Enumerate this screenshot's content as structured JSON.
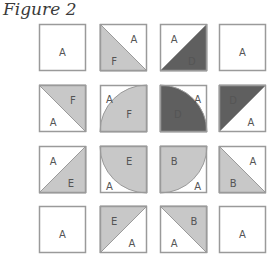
{
  "figure": {
    "title": "Figure 2",
    "colors": {
      "light": "#c8c8c8",
      "dark": "#5f5f5f",
      "white": "#ffffff",
      "border": "#9a9a9a"
    },
    "grid": [
      [
        {
          "type": "plain",
          "labels": [
            "A"
          ]
        },
        {
          "type": "hst-bl",
          "labels": [
            "A",
            "F"
          ],
          "fill": "light"
        },
        {
          "type": "hst-br",
          "labels": [
            "A",
            "D"
          ],
          "fill": "dark"
        },
        {
          "type": "plain",
          "labels": [
            "A"
          ]
        }
      ],
      [
        {
          "type": "hst-tr",
          "labels": [
            "F",
            "A"
          ],
          "fill": "light"
        },
        {
          "type": "quarter-br",
          "labels": [
            "A",
            "F"
          ],
          "fill": "light"
        },
        {
          "type": "quarter-bl",
          "labels": [
            "D",
            "A"
          ],
          "fill": "dark"
        },
        {
          "type": "hst-tl",
          "labels": [
            "D",
            "A"
          ],
          "fill": "dark"
        }
      ],
      [
        {
          "type": "hst-br",
          "labels": [
            "A",
            "E"
          ],
          "fill": "light"
        },
        {
          "type": "quarter-tr",
          "labels": [
            "E",
            "A"
          ],
          "fill": "light"
        },
        {
          "type": "quarter-tl",
          "labels": [
            "B",
            "A"
          ],
          "fill": "light"
        },
        {
          "type": "hst-bl",
          "labels": [
            "A",
            "B"
          ],
          "fill": "light"
        }
      ],
      [
        {
          "type": "plain",
          "labels": [
            "A"
          ]
        },
        {
          "type": "hst-tl",
          "labels": [
            "E",
            "A"
          ],
          "fill": "light"
        },
        {
          "type": "hst-tr",
          "labels": [
            "B",
            "A"
          ],
          "fill": "light"
        },
        {
          "type": "plain",
          "labels": [
            "A"
          ]
        }
      ]
    ]
  }
}
